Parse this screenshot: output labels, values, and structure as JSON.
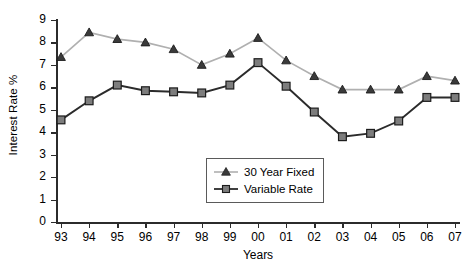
{
  "chart_data": {
    "type": "line",
    "title": "",
    "xlabel": "Years",
    "ylabel": "Interest Rate %",
    "categories": [
      "93",
      "94",
      "95",
      "96",
      "97",
      "98",
      "99",
      "00",
      "01",
      "02",
      "03",
      "04",
      "05",
      "06",
      "07"
    ],
    "x_tick_labels": [
      "93",
      "94",
      "95",
      "96",
      "97",
      "98",
      "99",
      "00",
      "01",
      "02",
      "03",
      "04",
      "05",
      "06",
      "07"
    ],
    "y_tick_labels": [
      "0",
      "1",
      "2",
      "3",
      "4",
      "5",
      "6",
      "7",
      "8",
      "9"
    ],
    "ylim": [
      0,
      9
    ],
    "grid": false,
    "legend_position": "inside-center-lower",
    "series": [
      {
        "name": "30 Year Fixed",
        "marker": "triangle",
        "line_color": "#b0b0b0",
        "marker_color": "#3a3a3a",
        "values": [
          7.35,
          8.45,
          8.15,
          8.0,
          7.7,
          7.0,
          7.5,
          8.2,
          7.2,
          6.5,
          5.9,
          5.9,
          5.9,
          6.5,
          6.3
        ]
      },
      {
        "name": "Variable Rate",
        "marker": "square",
        "line_color": "#2b2b2b",
        "marker_color": "#7d7d7d",
        "values": [
          4.55,
          5.4,
          6.1,
          5.85,
          5.8,
          5.75,
          6.1,
          7.1,
          6.05,
          4.9,
          3.8,
          3.95,
          4.5,
          5.55,
          5.55
        ]
      }
    ]
  },
  "legend": {
    "items": [
      {
        "label": "30 Year Fixed"
      },
      {
        "label": "Variable Rate"
      }
    ]
  },
  "colors": {
    "axis": "#2b2b2b",
    "fixed_line": "#b0b0b0",
    "variable_line": "#2b2b2b",
    "background": "#ffffff"
  }
}
